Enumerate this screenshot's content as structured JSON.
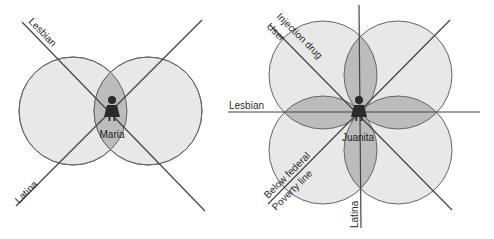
{
  "left_diagram": {
    "person": "Maria",
    "axes": [
      "Lesbian",
      "Latina"
    ],
    "colors": {
      "circle_fill": "#e6e6e6",
      "overlap_fill": "#bdbdbd",
      "stroke": "#555555"
    }
  },
  "right_diagram": {
    "person": "Juanita",
    "axes": [
      "Injection drug",
      "User",
      "Lesbian",
      "Below federal",
      "Poverty line",
      "Latina"
    ],
    "colors": {
      "circle_fill": "#e6e6e6",
      "overlap_fill": "#bdbdbd",
      "stroke": "#555555"
    }
  }
}
